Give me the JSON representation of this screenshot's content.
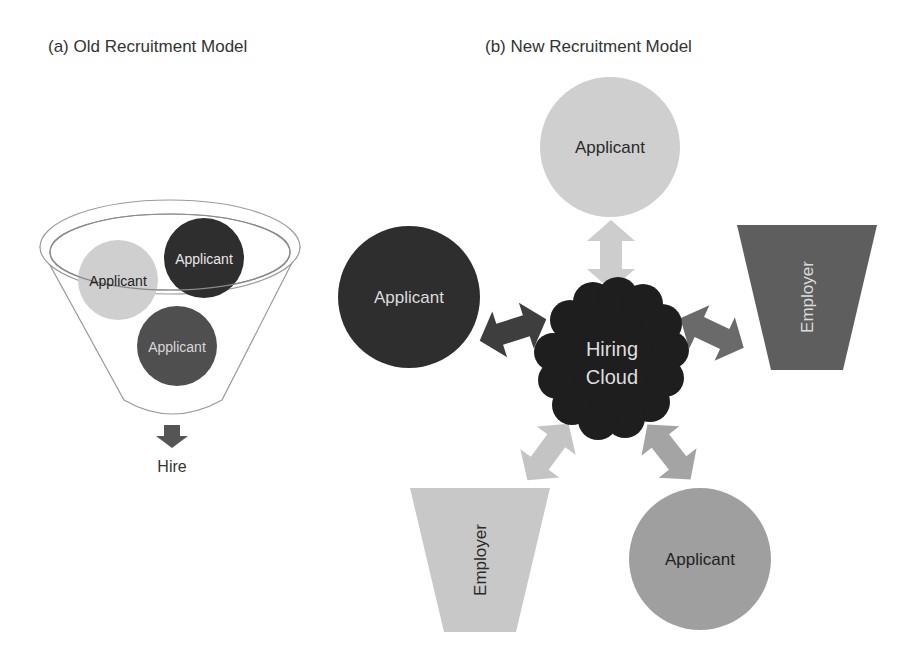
{
  "panel_a": {
    "title": "(a) Old Recruitment Model",
    "funnel_applicants": [
      {
        "label": "Applicant",
        "shade": "light"
      },
      {
        "label": "Applicant",
        "shade": "dark"
      },
      {
        "label": "Applicant",
        "shade": "medium-dark"
      }
    ],
    "output_label": "Hire"
  },
  "panel_b": {
    "title": "(b) New Recruitment Model",
    "center": {
      "line1": "Hiring",
      "line2": "Cloud"
    },
    "nodes": {
      "top_applicant": "Applicant",
      "left_applicant": "Applicant",
      "right_employer": "Employer",
      "bottom_left_employer": "Employer",
      "bottom_right_applicant": "Applicant"
    }
  },
  "colors": {
    "light": "#cfcfcf",
    "medium": "#a4a4a4",
    "medium_dark": "#6e6e6e",
    "dark": "#3a3a3a",
    "darkest": "#222222",
    "outline": "#8a8a8a"
  }
}
